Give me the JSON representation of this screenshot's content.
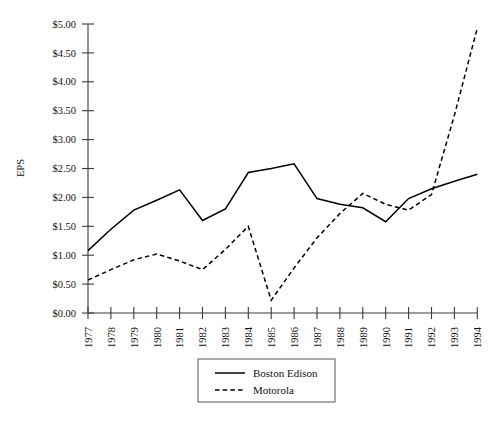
{
  "chart_data": {
    "type": "line",
    "title": "",
    "subtitle": "",
    "xlabel": "",
    "ylabel": "EPS",
    "xlim": [
      "1977",
      "1994"
    ],
    "ylim": [
      0.0,
      5.0
    ],
    "ytick_step": 0.5,
    "grid": false,
    "legend_position": "bottom-center",
    "x": [
      "1977",
      "1978",
      "1979",
      "1980",
      "1981",
      "1982",
      "1983",
      "1984",
      "1985",
      "1986",
      "1987",
      "1988",
      "1989",
      "1990",
      "1991",
      "1992",
      "1993",
      "1994"
    ],
    "ytick_labels": [
      "$0.00",
      "$0.50",
      "$1.00",
      "$1.50",
      "$2.00",
      "$2.50",
      "$3.00",
      "$3.50",
      "$4.00",
      "$4.50",
      "$5.00"
    ],
    "ytick_values": [
      0.0,
      0.5,
      1.0,
      1.5,
      2.0,
      2.5,
      3.0,
      3.5,
      4.0,
      4.5,
      5.0
    ],
    "series": [
      {
        "name": "Boston Edison",
        "style": "solid",
        "color": "#000000",
        "values": [
          1.08,
          1.45,
          1.78,
          1.95,
          2.13,
          1.6,
          1.8,
          2.43,
          2.5,
          2.58,
          1.98,
          1.88,
          1.82,
          1.58,
          1.98,
          2.15,
          2.28,
          2.4
        ]
      },
      {
        "name": "Motorola",
        "style": "dashed",
        "color": "#000000",
        "values": [
          0.57,
          0.75,
          0.92,
          1.02,
          0.9,
          0.75,
          1.1,
          1.5,
          0.22,
          0.78,
          1.3,
          1.72,
          2.07,
          1.88,
          1.78,
          2.05,
          3.42,
          4.93
        ]
      }
    ]
  },
  "axes": {
    "y_axis_title": "EPS"
  },
  "legend": {
    "entries": [
      {
        "label": "Boston Edison",
        "style": "solid"
      },
      {
        "label": "Motorola",
        "style": "dashed"
      }
    ]
  },
  "colors": {
    "axis": "#3a3a3a",
    "series_boston_edison": "#000000",
    "series_motorola": "#000000",
    "background": "#ffffff",
    "legend_border": "#555555"
  }
}
